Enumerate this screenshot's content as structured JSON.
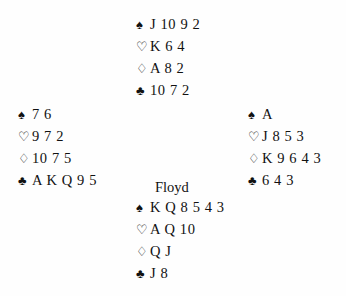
{
  "deal": {
    "background_color": "#fefefe",
    "ink_color": "#111111",
    "suit_glyphs": {
      "spades": "♠",
      "hearts": "♡",
      "diamonds": "♢",
      "clubs": "♣"
    },
    "suit_names": {
      "spades": "spade-suit-symbol",
      "hearts": "heart-suit-symbol",
      "diamonds": "diamond-suit-symbol",
      "clubs": "club-suit-symbol"
    },
    "hands": {
      "north": {
        "label": "",
        "spades": "J 10 9 2",
        "hearts": "K 6 4",
        "diamonds": "A 8 2",
        "clubs": "10 7 2"
      },
      "west": {
        "label": "",
        "spades": "7 6",
        "hearts": "9 7 2",
        "diamonds": "10 7 5",
        "clubs": "A K Q 9 5"
      },
      "east": {
        "label": "",
        "spades": "A",
        "hearts": "J 8 5 3",
        "diamonds": "K 9 6 4 3",
        "clubs": "6 4 3"
      },
      "south": {
        "label": "Floyd",
        "spades": "K Q 8 5 4 3",
        "hearts": "A Q 10",
        "diamonds": "Q J",
        "clubs": "J 8"
      }
    }
  }
}
